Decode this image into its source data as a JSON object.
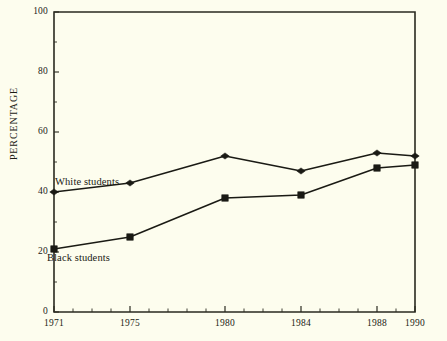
{
  "chart_data": {
    "type": "line",
    "title": "",
    "xlabel": "",
    "ylabel": "PERCENTAGE",
    "categories": [
      "1971",
      "1975",
      "1980",
      "1984",
      "1988",
      "1990"
    ],
    "x": [
      1971,
      1975,
      1980,
      1984,
      1988,
      1990
    ],
    "xlim": [
      1971,
      1990
    ],
    "ylim": [
      0,
      100
    ],
    "yticks": [
      0,
      20,
      40,
      60,
      80,
      100
    ],
    "ytick_labels": [
      "0",
      "20",
      "40",
      "60",
      "80",
      "100"
    ],
    "xtick_labels": [
      "1971",
      "1975",
      "1980",
      "1984",
      "1988",
      "1990"
    ],
    "grid": false,
    "legend_position": "inline-annotations",
    "series": [
      {
        "name": "White students",
        "marker": "diamond",
        "color": "#1a1a14",
        "values": [
          40,
          43,
          52,
          47,
          53,
          52
        ]
      },
      {
        "name": "Black students",
        "marker": "square",
        "color": "#1a1a14",
        "values": [
          21,
          25,
          38,
          39,
          48,
          49
        ]
      }
    ],
    "annotations": [
      {
        "text": "White students",
        "series": "White students"
      },
      {
        "text": "Black students",
        "series": "Black students"
      }
    ]
  },
  "style": {
    "background": "#fdfdee",
    "axis_color": "#2a2a20",
    "line_color": "#1a1a14"
  }
}
